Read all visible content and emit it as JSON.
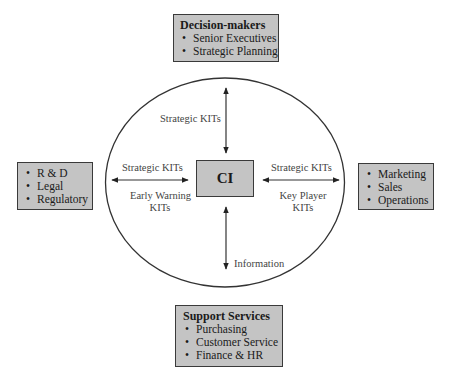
{
  "diagram": {
    "center": {
      "label": "CI"
    },
    "top_box": {
      "title": "Decision-makers",
      "items": [
        "Senior Executives",
        "Strategic Planning"
      ]
    },
    "left_box": {
      "items": [
        "R & D",
        "Legal",
        "Regulatory"
      ]
    },
    "right_box": {
      "items": [
        "Marketing",
        "Sales",
        "Operations"
      ]
    },
    "bottom_box": {
      "title": "Support Services",
      "items": [
        "Purchasing",
        "Customer Service",
        "Finance & HR"
      ]
    },
    "arrow_labels": {
      "top": "Strategic KITs",
      "left_above": "Strategic KITs",
      "left_below_1": "Early Warning",
      "left_below_2": "KITs",
      "right_above": "Strategic KITs",
      "right_below_1": "Key Player",
      "right_below_2": "KITs",
      "bottom": "Information"
    },
    "colors": {
      "box_fill": "#c4c4c4",
      "stroke": "#3a3a3a",
      "background": "#ffffff"
    }
  }
}
